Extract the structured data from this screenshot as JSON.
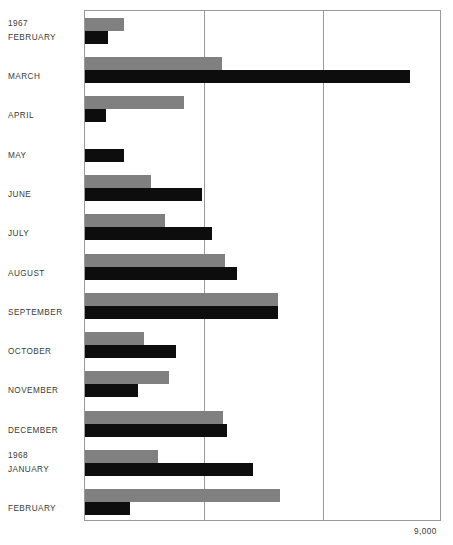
{
  "chart_data": {
    "type": "bar",
    "orientation": "horizontal",
    "title": "",
    "xlabel": "",
    "ylabel": "",
    "xlim": [
      0,
      9000
    ],
    "grid": true,
    "gridlines": [
      3000,
      6000
    ],
    "axis_max_label": "9,000",
    "legend": [],
    "year_markers": [
      {
        "label": "1967",
        "before_category": "FEBRUARY"
      },
      {
        "label": "1968",
        "before_category": "JANUARY"
      }
    ],
    "categories": [
      "FEBRUARY",
      "MARCH",
      "APRIL",
      "MAY",
      "JUNE",
      "JULY",
      "AUGUST",
      "SEPTEMBER",
      "OCTOBER",
      "NOVEMBER",
      "DECEMBER",
      "JANUARY",
      "FEBRUARY"
    ],
    "series": [
      {
        "name": "gray",
        "color": "#808080",
        "values": [
          980,
          3450,
          2500,
          0,
          1660,
          2010,
          3530,
          4860,
          1490,
          2120,
          3480,
          1840,
          4920
        ]
      },
      {
        "name": "black",
        "color": "#0d0d0d",
        "values": [
          580,
          8190,
          530,
          980,
          2950,
          3200,
          3830,
          4860,
          2290,
          1340,
          3580,
          4230,
          1130
        ]
      }
    ]
  },
  "labels": {
    "axis_max": "9,000"
  }
}
